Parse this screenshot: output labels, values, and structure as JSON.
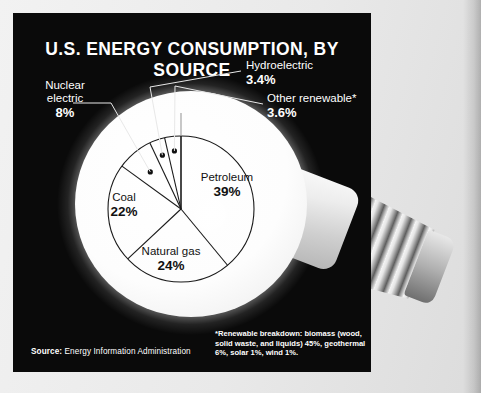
{
  "panel": {
    "title": "U.S. ENERGY CONSUMPTION, BY SOURCE",
    "background_color": "#0a0a0a",
    "text_color": "#ffffff"
  },
  "source": {
    "label": "Source:",
    "text": " Energy Information Administration"
  },
  "footnote": {
    "text": "*Renewable breakdown: biomass (wood, solid waste, and liquids) 45%, geothermal 6%, solar 1%, wind 1%."
  },
  "callouts": [
    {
      "name": "Nuclear\nelectric",
      "line1": "Nuclear",
      "line2": "electric",
      "value": "8%"
    },
    {
      "name": "Hydroelectric",
      "line1": "Hydroelectric",
      "line2": "",
      "value": "3.4%"
    },
    {
      "name": "Other renewable*",
      "line1": "Other renewable*",
      "line2": "",
      "value": "3.6%"
    }
  ],
  "pie_labels": [
    {
      "name": "Petroleum",
      "value": "39%"
    },
    {
      "name": "Coal",
      "value": "22%"
    },
    {
      "name": "Natural gas",
      "value": "24%"
    }
  ],
  "chart_data": {
    "type": "pie",
    "title": "U.S. ENERGY CONSUMPTION, BY SOURCE",
    "subtitle": "",
    "xlabel": "",
    "ylabel": "",
    "legend_position": "callout-labels",
    "grid": false,
    "units": "percent",
    "start_angle_deg": 0,
    "direction": "clockwise",
    "labels": [
      "Petroleum",
      "Natural gas",
      "Coal",
      "Nuclear electric",
      "Hydroelectric",
      "Other renewable*"
    ],
    "values": [
      39,
      24,
      22,
      8,
      3.4,
      3.6
    ],
    "value_labels": [
      "39%",
      "24%",
      "22%",
      "8%",
      "3.4%",
      "3.6%"
    ],
    "slice_colors": [
      "#ffffff",
      "#ffffff",
      "#ffffff",
      "#ffffff",
      "#ffffff",
      "#ffffff"
    ],
    "stroke_color": "#1a1a1a",
    "label_placement": [
      "inside",
      "inside",
      "inside",
      "outside",
      "outside",
      "outside"
    ],
    "source": "Energy Information Administration",
    "annotations": [
      "*Renewable breakdown: biomass (wood, solid waste, and liquids) 45%, geothermal 6%, solar 1%, wind 1%."
    ]
  }
}
